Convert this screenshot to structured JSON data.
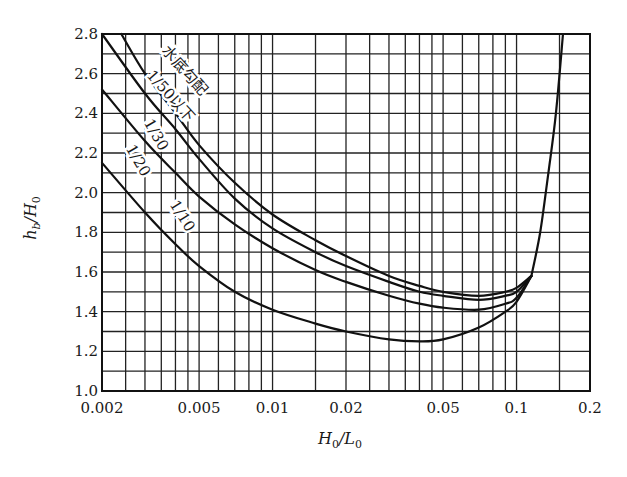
{
  "chart_data": {
    "type": "line",
    "title": "",
    "xlabel": "H0/L0",
    "ylabel": "hb/H0",
    "xscale": "log",
    "xlim": [
      0.002,
      0.2
    ],
    "ylim": [
      1.0,
      2.8
    ],
    "grid": true,
    "x_ticks": [
      {
        "value": 0.002,
        "label": "0.002"
      },
      {
        "value": 0.005,
        "label": "0.005"
      },
      {
        "value": 0.01,
        "label": "0.01"
      },
      {
        "value": 0.02,
        "label": "0.02"
      },
      {
        "value": 0.05,
        "label": "0.05"
      },
      {
        "value": 0.1,
        "label": "0.1"
      },
      {
        "value": 0.2,
        "label": "0.2"
      }
    ],
    "y_ticks": [
      {
        "value": 1.0,
        "label": "1.0"
      },
      {
        "value": 1.2,
        "label": "1.2"
      },
      {
        "value": 1.4,
        "label": "1.4"
      },
      {
        "value": 1.6,
        "label": "1.6"
      },
      {
        "value": 1.8,
        "label": "1.8"
      },
      {
        "value": 2.0,
        "label": "2.0"
      },
      {
        "value": 2.2,
        "label": "2.2"
      },
      {
        "value": 2.4,
        "label": "2.4"
      },
      {
        "value": 2.6,
        "label": "2.6"
      },
      {
        "value": 2.8,
        "label": "2.8"
      }
    ],
    "x_gridlines": [
      0.0025,
      0.003,
      0.0035,
      0.004,
      0.0045,
      0.005,
      0.006,
      0.007,
      0.008,
      0.009,
      0.01,
      0.015,
      0.02,
      0.025,
      0.03,
      0.035,
      0.04,
      0.045,
      0.05,
      0.06,
      0.07,
      0.08,
      0.09,
      0.1,
      0.15,
      0.2
    ],
    "y_gridlines": [
      1.1,
      1.2,
      1.3,
      1.4,
      1.5,
      1.6,
      1.7,
      1.8,
      1.9,
      2.0,
      2.1,
      2.2,
      2.3,
      2.4,
      2.5,
      2.6,
      2.7,
      2.8
    ],
    "series": [
      {
        "name": "水底勾配 1/50以下",
        "x": [
          0.0024,
          0.003,
          0.004,
          0.005,
          0.007,
          0.01,
          0.015,
          0.02,
          0.03,
          0.04,
          0.05,
          0.07,
          0.09,
          0.1,
          0.115
        ],
        "y": [
          2.8,
          2.6,
          2.4,
          2.24,
          2.05,
          1.89,
          1.76,
          1.68,
          1.58,
          1.53,
          1.5,
          1.48,
          1.5,
          1.52,
          1.58
        ]
      },
      {
        "name": "1/30",
        "x": [
          0.002,
          0.003,
          0.004,
          0.005,
          0.007,
          0.01,
          0.015,
          0.02,
          0.03,
          0.04,
          0.05,
          0.07,
          0.09,
          0.1,
          0.115
        ],
        "y": [
          2.8,
          2.5,
          2.32,
          2.17,
          1.97,
          1.82,
          1.7,
          1.63,
          1.55,
          1.5,
          1.48,
          1.46,
          1.48,
          1.5,
          1.58
        ]
      },
      {
        "name": "1/20",
        "x": [
          0.002,
          0.003,
          0.004,
          0.005,
          0.007,
          0.01,
          0.015,
          0.02,
          0.03,
          0.04,
          0.05,
          0.07,
          0.09,
          0.1,
          0.115
        ],
        "y": [
          2.52,
          2.26,
          2.1,
          1.98,
          1.84,
          1.72,
          1.61,
          1.55,
          1.48,
          1.44,
          1.42,
          1.41,
          1.44,
          1.47,
          1.58
        ]
      },
      {
        "name": "1/10",
        "x": [
          0.002,
          0.003,
          0.004,
          0.005,
          0.007,
          0.01,
          0.015,
          0.02,
          0.03,
          0.04,
          0.05,
          0.07,
          0.09,
          0.1,
          0.115
        ],
        "y": [
          2.15,
          1.9,
          1.74,
          1.63,
          1.5,
          1.41,
          1.34,
          1.3,
          1.26,
          1.25,
          1.26,
          1.32,
          1.4,
          1.45,
          1.58
        ]
      },
      {
        "name": "limit (common rising branch)",
        "x": [
          0.115,
          0.125,
          0.135,
          0.145,
          0.155
        ],
        "y": [
          1.58,
          1.8,
          2.1,
          2.4,
          2.8
        ]
      }
    ],
    "annotations": [
      {
        "text": "水底勾配",
        "x": 0.0042,
        "y": 2.6,
        "rotation": 48
      },
      {
        "text": "1/50以下",
        "x": 0.0037,
        "y": 2.47,
        "rotation": 48
      },
      {
        "text": "1/30",
        "x": 0.0032,
        "y": 2.28,
        "rotation": 60
      },
      {
        "text": "1/20",
        "x": 0.0027,
        "y": 2.15,
        "rotation": 60
      },
      {
        "text": "1/10",
        "x": 0.0041,
        "y": 1.87,
        "rotation": 58
      }
    ]
  },
  "labels": {
    "x_axis": "H₀/L₀",
    "y_axis": "h_b/H₀"
  }
}
